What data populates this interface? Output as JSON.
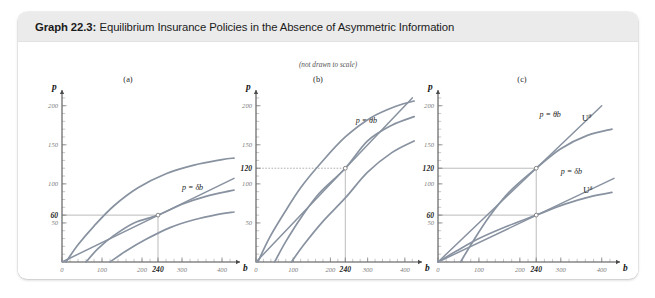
{
  "figure": {
    "label": "Graph 22.3:",
    "title": "Equilibrium Insurance Policies in the Absence of Asymmetric Information",
    "note": "(not drawn to scale)"
  },
  "colors": {
    "curve": "#8892a0",
    "axis": "#4a4a4a",
    "header_bg": "#ebebeb",
    "guide": "#8d8d8d"
  },
  "axes": {
    "xlabel": "b",
    "ylabel": "p",
    "xlim": [
      0,
      430
    ],
    "ylim": [
      0,
      215
    ],
    "x_ticks": [
      {
        "value": 0,
        "label": "0",
        "bold": false
      },
      {
        "value": 100,
        "label": "100",
        "bold": false
      },
      {
        "value": 200,
        "label": "200",
        "bold": false
      },
      {
        "value": 240,
        "label": "240",
        "bold": true
      },
      {
        "value": 300,
        "label": "300",
        "bold": false
      },
      {
        "value": 400,
        "label": "400",
        "bold": false
      }
    ],
    "x_minor_step": 20,
    "y_minor_step": 10
  },
  "chart_data": [
    {
      "type": "line",
      "panel": "(a)",
      "title": "Low-risk type delta equilibrium",
      "xlabel": "b",
      "ylabel": "p",
      "xlim": [
        0,
        430
      ],
      "ylim": [
        0,
        215
      ],
      "grid": false,
      "y_ticks": [
        {
          "value": 50,
          "label": "50",
          "bold": false
        },
        {
          "value": 60,
          "label": "60",
          "bold": true
        },
        {
          "value": 100,
          "label": "100",
          "bold": false
        },
        {
          "value": 150,
          "label": "150",
          "bold": false
        },
        {
          "value": 200,
          "label": "200",
          "bold": false
        }
      ],
      "equilibrium": [
        {
          "x": 240,
          "y": 60,
          "label": ""
        }
      ],
      "guides": [
        {
          "from": [
            0,
            60
          ],
          "to": [
            240,
            60
          ],
          "style": "solid"
        },
        {
          "from": [
            240,
            0
          ],
          "to": [
            240,
            60
          ],
          "style": "solid"
        }
      ],
      "series": [
        {
          "name": "p = db",
          "kind": "ray",
          "slope": 0.25,
          "label": "p = δb",
          "label_x": 300,
          "label_y": 92,
          "points": [
            [
              0,
              0
            ],
            [
              430,
              107
            ]
          ]
        },
        {
          "name": "U-delta upper",
          "kind": "curve",
          "label": "",
          "points": [
            [
              10,
              0
            ],
            [
              40,
              22
            ],
            [
              80,
              46
            ],
            [
              130,
              72
            ],
            [
              190,
              95
            ],
            [
              260,
              113
            ],
            [
              330,
              124
            ],
            [
              400,
              131
            ],
            [
              430,
              133
            ]
          ]
        },
        {
          "name": "U-delta equilibrium",
          "kind": "curve",
          "label": "",
          "points": [
            [
              60,
              0
            ],
            [
              90,
              17
            ],
            [
              130,
              34
            ],
            [
              180,
              50
            ],
            [
              240,
              60
            ],
            [
              300,
              74
            ],
            [
              360,
              84
            ],
            [
              420,
              91
            ],
            [
              430,
              92
            ]
          ]
        },
        {
          "name": "U-delta lower",
          "kind": "curve",
          "label": "",
          "points": [
            [
              120,
              0
            ],
            [
              160,
              14
            ],
            [
              210,
              29
            ],
            [
              270,
              44
            ],
            [
              330,
              54
            ],
            [
              390,
              61
            ],
            [
              430,
              64
            ]
          ]
        }
      ]
    },
    {
      "type": "line",
      "panel": "(b)",
      "title": "High-risk type theta equilibrium",
      "xlabel": "b",
      "ylabel": "p",
      "xlim": [
        0,
        430
      ],
      "ylim": [
        0,
        215
      ],
      "grid": false,
      "y_ticks": [
        {
          "value": 50,
          "label": "50",
          "bold": false
        },
        {
          "value": 100,
          "label": "100",
          "bold": false
        },
        {
          "value": 120,
          "label": "120",
          "bold": true
        },
        {
          "value": 150,
          "label": "150",
          "bold": false
        },
        {
          "value": 200,
          "label": "200",
          "bold": false
        }
      ],
      "equilibrium": [
        {
          "x": 240,
          "y": 120,
          "label": ""
        }
      ],
      "guides": [
        {
          "from": [
            0,
            120
          ],
          "to": [
            240,
            120
          ],
          "style": "dotted"
        },
        {
          "from": [
            240,
            0
          ],
          "to": [
            240,
            120
          ],
          "style": "solid"
        }
      ],
      "series": [
        {
          "name": "p = theta b",
          "kind": "ray",
          "slope": 0.5,
          "label": "p = θb",
          "label_x": 268,
          "label_y": 178,
          "points": [
            [
              0,
              0
            ],
            [
              420,
              210
            ]
          ]
        },
        {
          "name": "U-theta upper",
          "kind": "curve",
          "label": "",
          "points": [
            [
              5,
              0
            ],
            [
              35,
              30
            ],
            [
              75,
              62
            ],
            [
              120,
              95
            ],
            [
              175,
              127
            ],
            [
              240,
              160
            ],
            [
              310,
              185
            ],
            [
              380,
              200
            ],
            [
              425,
              206
            ]
          ]
        },
        {
          "name": "U-theta equilibrium",
          "kind": "curve",
          "label": "",
          "points": [
            [
              50,
              0
            ],
            [
              80,
              26
            ],
            [
              120,
              56
            ],
            [
              170,
              88
            ],
            [
              240,
              120
            ],
            [
              300,
              155
            ],
            [
              365,
              175
            ],
            [
              425,
              186
            ]
          ]
        },
        {
          "name": "U-theta lower",
          "kind": "curve",
          "label": "",
          "points": [
            [
              95,
              0
            ],
            [
              130,
              23
            ],
            [
              180,
              52
            ],
            [
              240,
              82
            ],
            [
              300,
              115
            ],
            [
              365,
              140
            ],
            [
              425,
              155
            ]
          ]
        }
      ]
    },
    {
      "type": "line",
      "panel": "(c)",
      "title": "Both equilibria combined",
      "xlabel": "b",
      "ylabel": "p",
      "xlim": [
        0,
        430
      ],
      "ylim": [
        0,
        215
      ],
      "grid": false,
      "y_ticks": [
        {
          "value": 50,
          "label": "50",
          "bold": false
        },
        {
          "value": 60,
          "label": "60",
          "bold": true
        },
        {
          "value": 100,
          "label": "100",
          "bold": false
        },
        {
          "value": 120,
          "label": "120",
          "bold": true
        },
        {
          "value": 150,
          "label": "150",
          "bold": false
        },
        {
          "value": 200,
          "label": "200",
          "bold": false
        }
      ],
      "equilibrium": [
        {
          "x": 240,
          "y": 120,
          "label": ""
        },
        {
          "x": 240,
          "y": 60,
          "label": ""
        }
      ],
      "guides": [
        {
          "from": [
            0,
            120
          ],
          "to": [
            240,
            120
          ],
          "style": "solid"
        },
        {
          "from": [
            0,
            60
          ],
          "to": [
            240,
            60
          ],
          "style": "solid"
        },
        {
          "from": [
            240,
            0
          ],
          "to": [
            240,
            120
          ],
          "style": "solid"
        }
      ],
      "series": [
        {
          "name": "p = theta b",
          "kind": "ray",
          "slope": 0.5,
          "label": "p = θb",
          "label_x": 248,
          "label_y": 186,
          "points": [
            [
              0,
              0
            ],
            [
              400,
              200
            ]
          ]
        },
        {
          "name": "U theta",
          "kind": "curve",
          "label": "U",
          "label_sup": "θ",
          "label_x": 352,
          "label_y": 181,
          "points": [
            [
              55,
              0
            ],
            [
              85,
              26
            ],
            [
              125,
              58
            ],
            [
              175,
              90
            ],
            [
              240,
              120
            ],
            [
              300,
              145
            ],
            [
              365,
              162
            ],
            [
              425,
              170
            ]
          ]
        },
        {
          "name": "p = db",
          "kind": "ray",
          "slope": 0.25,
          "label": "p = δb",
          "label_x": 300,
          "label_y": 112,
          "points": [
            [
              0,
              0
            ],
            [
              430,
              107
            ]
          ]
        },
        {
          "name": "U delta",
          "kind": "curve",
          "label": "U",
          "label_sup": "δ",
          "label_x": 355,
          "label_y": 88,
          "points": [
            [
              0,
              0
            ],
            [
              45,
              14
            ],
            [
              100,
              30
            ],
            [
              170,
              46
            ],
            [
              240,
              60
            ],
            [
              310,
              74
            ],
            [
              375,
              84
            ],
            [
              425,
              89
            ]
          ]
        }
      ]
    }
  ]
}
